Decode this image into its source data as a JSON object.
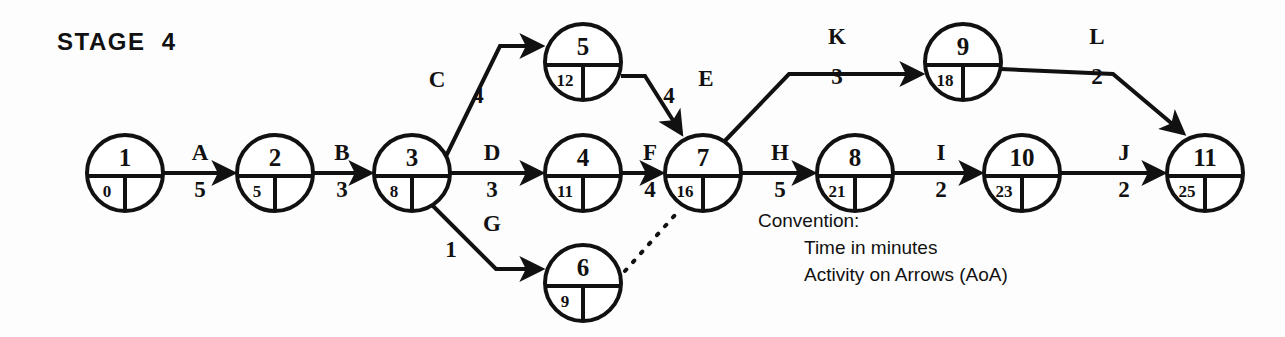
{
  "title": "STAGE  4",
  "convention": {
    "heading": "Convention:",
    "line1": "Time in minutes",
    "line2": "Activity on Arrows (AoA)"
  },
  "colors": {
    "ink": "#111111",
    "paper": "#fdfdfd"
  },
  "chart_data": {
    "type": "diagram",
    "diagram_kind": "activity-on-arrow-network",
    "title": "STAGE  4",
    "units": "minutes",
    "nodes": [
      {
        "id": "1",
        "event": "1",
        "earliest": "0",
        "latest": "",
        "x": 125,
        "y": 173
      },
      {
        "id": "2",
        "event": "2",
        "earliest": "5",
        "latest": "",
        "x": 275,
        "y": 173
      },
      {
        "id": "3",
        "event": "3",
        "earliest": "8",
        "latest": "",
        "x": 412,
        "y": 173
      },
      {
        "id": "4",
        "event": "4",
        "earliest": "11",
        "latest": "",
        "x": 583,
        "y": 173
      },
      {
        "id": "5",
        "event": "5",
        "earliest": "12",
        "latest": "",
        "x": 583,
        "y": 62
      },
      {
        "id": "6",
        "event": "6",
        "earliest": "9",
        "latest": "",
        "x": 583,
        "y": 283
      },
      {
        "id": "7",
        "event": "7",
        "earliest": "16",
        "latest": "",
        "x": 703,
        "y": 173
      },
      {
        "id": "8",
        "event": "8",
        "earliest": "21",
        "latest": "",
        "x": 855,
        "y": 173
      },
      {
        "id": "9",
        "event": "9",
        "earliest": "18",
        "latest": "",
        "x": 963,
        "y": 62
      },
      {
        "id": "10",
        "event": "10",
        "earliest": "23",
        "latest": "",
        "x": 1022,
        "y": 173
      },
      {
        "id": "11",
        "event": "11",
        "earliest": "25",
        "latest": "",
        "x": 1205,
        "y": 173
      }
    ],
    "activities": [
      {
        "name": "A",
        "duration": "5",
        "from": "1",
        "to": "2",
        "label_x": 200,
        "label_y": 160,
        "dur_x": 200,
        "dur_y": 197
      },
      {
        "name": "B",
        "duration": "3",
        "from": "2",
        "to": "3",
        "label_x": 342,
        "label_y": 160,
        "dur_x": 342,
        "dur_y": 197
      },
      {
        "name": "C",
        "duration": "4",
        "from": "3",
        "to": "5",
        "label_x": 437,
        "label_y": 87,
        "dur_x": 478,
        "dur_y": 103
      },
      {
        "name": "D",
        "duration": "3",
        "from": "3",
        "to": "4",
        "label_x": 492,
        "label_y": 160,
        "dur_x": 492,
        "dur_y": 197
      },
      {
        "name": "E",
        "duration": "4",
        "from": "5",
        "to": "7",
        "label_x": 706,
        "label_y": 86,
        "dur_x": 669,
        "dur_y": 103
      },
      {
        "name": "F",
        "duration": "4",
        "from": "4",
        "to": "7",
        "label_x": 650,
        "label_y": 160,
        "dur_x": 650,
        "dur_y": 197
      },
      {
        "name": "G",
        "duration": "1",
        "from": "3",
        "to": "6",
        "label_x": 492,
        "label_y": 231,
        "dur_x": 451,
        "dur_y": 257
      },
      {
        "name": "H",
        "duration": "5",
        "from": "7",
        "to": "8",
        "label_x": 780,
        "label_y": 160,
        "dur_x": 780,
        "dur_y": 197
      },
      {
        "name": "I",
        "duration": "2",
        "from": "8",
        "to": "10",
        "label_x": 941,
        "label_y": 160,
        "dur_x": 941,
        "dur_y": 197
      },
      {
        "name": "J",
        "duration": "2",
        "from": "10",
        "to": "11",
        "label_x": 1124,
        "label_y": 160,
        "dur_x": 1124,
        "dur_y": 197
      },
      {
        "name": "K",
        "duration": "3",
        "from": "7",
        "to": "9",
        "label_x": 837,
        "label_y": 44,
        "dur_x": 837,
        "dur_y": 84
      },
      {
        "name": "L",
        "duration": "2",
        "from": "9",
        "to": "11",
        "label_x": 1097,
        "label_y": 44,
        "dur_x": 1097,
        "dur_y": 84
      }
    ],
    "dummy_links": [
      {
        "from": "6",
        "to": "7",
        "style": "dotted"
      }
    ]
  }
}
